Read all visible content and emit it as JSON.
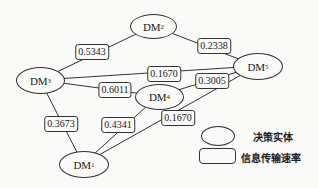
{
  "nodes": [
    {
      "id": "DM1",
      "base": "DM",
      "sub": "1",
      "cx": 83,
      "cy": 164
    },
    {
      "id": "DM2",
      "base": "DM",
      "sub": "2",
      "cx": 153,
      "cy": 26
    },
    {
      "id": "DM3",
      "base": "DM",
      "sub": "3",
      "cx": 40,
      "cy": 80
    },
    {
      "id": "DM4",
      "base": "DM",
      "sub": "4",
      "cx": 158,
      "cy": 96
    },
    {
      "id": "DM5",
      "base": "DM",
      "sub": "5",
      "cx": 257,
      "cy": 66
    }
  ],
  "edges": [
    {
      "from": "DM3",
      "to": "DM2",
      "rate": "0.5343",
      "lx": 92,
      "ly": 52
    },
    {
      "from": "DM2",
      "to": "DM5",
      "rate": "0.2338",
      "lx": 214,
      "ly": 46
    },
    {
      "from": "DM3",
      "to": "DM5",
      "rate": "0.1670",
      "lx": 164,
      "ly": 74
    },
    {
      "from": "DM3",
      "to": "DM4",
      "rate": "0.6011",
      "lx": 115,
      "ly": 90
    },
    {
      "from": "DM4",
      "to": "DM5",
      "rate": "0.3005",
      "lx": 212,
      "ly": 81
    },
    {
      "from": "DM3",
      "to": "DM1",
      "rate": "0.3673",
      "lx": 61,
      "ly": 124
    },
    {
      "from": "DM1",
      "to": "DM4",
      "rate": "0.4341",
      "lx": 118,
      "ly": 125
    },
    {
      "from": "DM1",
      "to": "DM5",
      "rate": "0.1670",
      "lx": 178,
      "ly": 118
    }
  ],
  "legend": {
    "entity_label": "决策实体",
    "rate_label": "信息传输速率"
  }
}
